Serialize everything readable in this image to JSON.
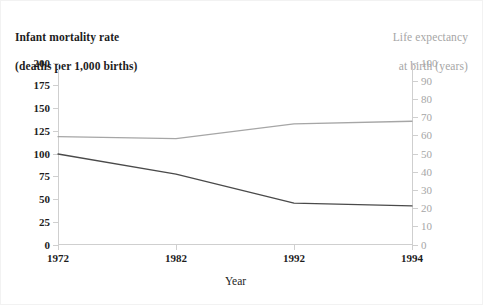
{
  "chart_data": {
    "type": "line",
    "title": "",
    "xlabel": "Year",
    "x": [
      "1972",
      "1982",
      "1992",
      "1994"
    ],
    "x_tick_labels": [
      "1972",
      "1982",
      "1992",
      "1994"
    ],
    "grid": false,
    "legend": "none",
    "axes": {
      "left": {
        "label": "Infant mortality rate\n(deaths per 1,000 births)",
        "label_line1": "Infant mortality rate",
        "label_line2": "(deaths per 1,000 births)",
        "ylim": [
          0,
          200
        ],
        "tick_step": 25,
        "ticks": [
          0,
          25,
          50,
          75,
          100,
          125,
          150,
          175,
          200
        ],
        "color": "#1d1d1d"
      },
      "right": {
        "label": "Life expectancy\nat birth (years)",
        "label_line1": "Life expectancy",
        "label_line2": "at birth (years)",
        "ylim": [
          0,
          100
        ],
        "tick_step": 10,
        "ticks": [
          0,
          10,
          20,
          30,
          40,
          50,
          60,
          70,
          80,
          90,
          100
        ],
        "color": "#a6a6a6"
      }
    },
    "series": [
      {
        "name": "Infant mortality rate",
        "axis": "left",
        "color": "#4a4a4a",
        "values": [
          100,
          78,
          46,
          43
        ]
      },
      {
        "name": "Life expectancy at birth",
        "axis": "right",
        "color": "#a6a6a6",
        "values": [
          59.5,
          58.5,
          66.5,
          68
        ]
      }
    ]
  }
}
